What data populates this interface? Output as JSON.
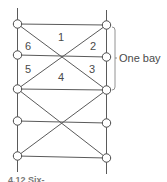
{
  "diagram": {
    "bay_label": "One bay",
    "caption": "4.12 Six-",
    "panel_labels": [
      {
        "id": "1",
        "text": "1",
        "x": 58,
        "y": 32
      },
      {
        "id": "2",
        "text": "2",
        "x": 90,
        "y": 41
      },
      {
        "id": "3",
        "text": "3",
        "x": 89,
        "y": 64
      },
      {
        "id": "4",
        "text": "4",
        "x": 58,
        "y": 72
      },
      {
        "id": "5",
        "text": "5",
        "x": 25,
        "y": 64
      },
      {
        "id": "6",
        "text": "6",
        "x": 25,
        "y": 41
      }
    ],
    "colors": {
      "line": "#5a5a5a",
      "node_fill": "#ffffff",
      "node_stroke": "#4a4a4a"
    }
  }
}
